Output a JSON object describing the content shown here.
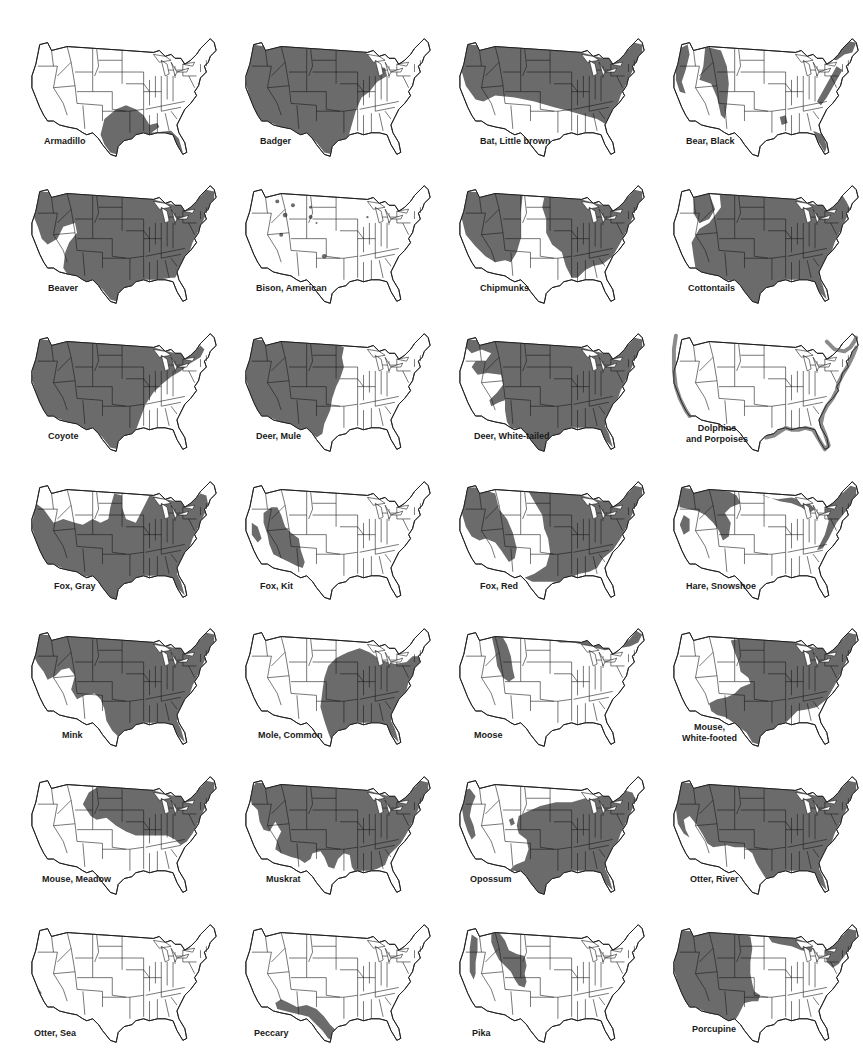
{
  "figure": {
    "type": "range-map-grid",
    "rows": 7,
    "columns": 4,
    "region": "Contiguous United States",
    "range_color": "#6b6b6b",
    "outline_color": "#1a1a1a",
    "background": "#ffffff"
  },
  "maps": [
    {
      "label": "Armadillo",
      "label_lines": [
        "Armadillo"
      ],
      "range": [
        "south-central",
        "gulf-coast",
        "florida"
      ],
      "shape": "armadillo"
    },
    {
      "label": "Badger",
      "label_lines": [
        "Badger"
      ],
      "range": [
        "west",
        "great-plains",
        "upper-midwest"
      ],
      "shape": "badger"
    },
    {
      "label": "Bat, Little brown",
      "label_lines": [
        "Bat, Little brown"
      ],
      "range": [
        "north",
        "east",
        "appalachia"
      ],
      "shape": "bat"
    },
    {
      "label": "Bear, Black",
      "label_lines": [
        "Bear, Black"
      ],
      "range": [
        "rockies",
        "pacific-coast",
        "northern-border",
        "appalachia",
        "florida",
        "ozarks"
      ],
      "shape": "bear"
    },
    {
      "label": "Beaver",
      "label_lines": [
        "Beaver"
      ],
      "range": [
        "nearly-all-except-desert-southwest"
      ],
      "shape": "beaver"
    },
    {
      "label": "Bison, American",
      "label_lines": [
        "Bison, American"
      ],
      "range": [
        "scattered-refuges"
      ],
      "shape": "bison"
    },
    {
      "label": "Chipmunks",
      "label_lines": [
        "Chipmunks"
      ],
      "range": [
        "west",
        "east",
        "excluding-great-plains"
      ],
      "shape": "chipmunk"
    },
    {
      "label": "Cottontails",
      "label_lines": [
        "Cottontails"
      ],
      "range": [
        "nearly-all"
      ],
      "shape": "cottontail"
    },
    {
      "label": "Coyote",
      "label_lines": [
        "Coyote"
      ],
      "range": [
        "west",
        "plains",
        "midwest",
        "northeast"
      ],
      "shape": "coyote"
    },
    {
      "label": "Deer, Mule",
      "label_lines": [
        "Deer, Mule"
      ],
      "range": [
        "west",
        "western-plains"
      ],
      "shape": "mule"
    },
    {
      "label": "Deer, White-tailed",
      "label_lines": [
        "Deer, White-tailed"
      ],
      "range": [
        "nearly-all-except-great-basin"
      ],
      "shape": "whitetail"
    },
    {
      "label": "Dolphins and Porpoises",
      "label_lines": [
        "Dolphins",
        "and Porpoises"
      ],
      "range": [
        "pacific-coast",
        "atlantic-coast",
        "gulf-coast"
      ],
      "shape": "dolphin"
    },
    {
      "label": "Fox, Gray",
      "label_lines": [
        "Fox, Gray"
      ],
      "range": [
        "east",
        "southwest",
        "pacific-coast"
      ],
      "shape": "grayfox"
    },
    {
      "label": "Fox, Kit",
      "label_lines": [
        "Fox, Kit"
      ],
      "range": [
        "desert-southwest",
        "great-basin"
      ],
      "shape": "kitfox"
    },
    {
      "label": "Fox, Red",
      "label_lines": [
        "Fox, Red"
      ],
      "range": [
        "north",
        "east",
        "rockies"
      ],
      "shape": "redfox"
    },
    {
      "label": "Hare, Snowshoe",
      "label_lines": [
        "Hare, Snowshoe"
      ],
      "range": [
        "northern-rockies",
        "pacific-northwest",
        "great-lakes",
        "new-england",
        "appalachia"
      ],
      "shape": "hare"
    },
    {
      "label": "Mink",
      "label_lines": [
        "Mink"
      ],
      "range": [
        "nearly-all-except-southwest"
      ],
      "shape": "mink"
    },
    {
      "label": "Mole, Common",
      "label_lines": [
        "Mole, Common"
      ],
      "range": [
        "east",
        "central-plains"
      ],
      "shape": "mole"
    },
    {
      "label": "Moose",
      "label_lines": [
        "Moose"
      ],
      "range": [
        "northern-rockies",
        "northern-border",
        "maine"
      ],
      "shape": "moose"
    },
    {
      "label": "Mouse, White-footed",
      "label_lines": [
        "Mouse,",
        "White-footed"
      ],
      "range": [
        "east",
        "plains",
        "southwest"
      ],
      "shape": "wfmouse"
    },
    {
      "label": "Mouse, Meadow",
      "label_lines": [
        "Mouse, Meadow"
      ],
      "range": [
        "north",
        "northeast",
        "appalachia"
      ],
      "shape": "meadow"
    },
    {
      "label": "Muskrat",
      "label_lines": [
        "Muskrat"
      ],
      "range": [
        "nearly-all-except-southwest-and-florida"
      ],
      "shape": "muskrat"
    },
    {
      "label": "Opossum",
      "label_lines": [
        "Opossum"
      ],
      "range": [
        "east",
        "pacific-coast"
      ],
      "shape": "opossum"
    },
    {
      "label": "Otter, River",
      "label_lines": [
        "Otter, River"
      ],
      "range": [
        "nearly-all-except-southwest"
      ],
      "shape": "otter"
    },
    {
      "label": "Otter, Sea",
      "label_lines": [
        "Otter, Sea"
      ],
      "range": [
        "central-california-coast"
      ],
      "shape": "seaotter"
    },
    {
      "label": "Peccary",
      "label_lines": [
        "Peccary"
      ],
      "range": [
        "southern-arizona",
        "new-mexico",
        "south-texas"
      ],
      "shape": "peccary"
    },
    {
      "label": "Pika",
      "label_lines": [
        "Pika"
      ],
      "range": [
        "rockies",
        "sierra-nevada",
        "cascades"
      ],
      "shape": "pika"
    },
    {
      "label": "Porcupine",
      "label_lines": [
        "Porcupine"
      ],
      "range": [
        "west",
        "great-lakes",
        "new-england"
      ],
      "shape": "porcupine"
    }
  ]
}
